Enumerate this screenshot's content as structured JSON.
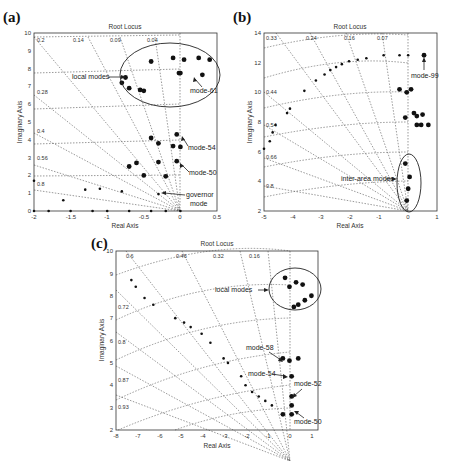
{
  "figure": {
    "panels": [
      {
        "id": "a",
        "label": "(a)",
        "title": "Root Locus",
        "xlabel": "Real Axis",
        "ylabel": "Imaginary Axis",
        "xticks": [
          "-2",
          "-1.5",
          "-1",
          "-0.5",
          "0",
          "0.5"
        ],
        "yticks": [
          "0",
          "1",
          "2",
          "3",
          "4",
          "5",
          "6",
          "7",
          "8",
          "9",
          "10"
        ],
        "damping_labels": [
          "0.2",
          "0.14",
          "0.09",
          "0.04",
          "0.28",
          "0.4",
          "0.56",
          "0.8"
        ],
        "annotations": [
          "local modes",
          "mode-61",
          "mode-54",
          "mode-50",
          "governor",
          "mode"
        ]
      },
      {
        "id": "b",
        "label": "(b)",
        "title": "Root Locus",
        "xlabel": "Real Axis",
        "ylabel": "Imaginary Axis",
        "xticks": [
          "-5",
          "-4",
          "-3",
          "-2",
          "-1",
          "0",
          "1"
        ],
        "yticks": [
          "2",
          "4",
          "6",
          "8",
          "10",
          "12",
          "14"
        ],
        "damping_labels": [
          "0.33",
          "0.24",
          "0.16",
          "0.07",
          "0.44",
          "0.54",
          "0.66",
          "0.8"
        ],
        "annotations": [
          "mode-99",
          "inter-area modes"
        ]
      },
      {
        "id": "c",
        "label": "(c)",
        "title": "Root Locus",
        "xlabel": "Real Axis",
        "ylabel": "Imaginary Axis",
        "xticks": [
          "-8",
          "-7",
          "-6",
          "-5",
          "-4",
          "-3",
          "-2",
          "-1",
          "0",
          "1"
        ],
        "yticks": [
          "2",
          "3",
          "4",
          "5",
          "6",
          "7",
          "8",
          "9",
          "10"
        ],
        "damping_labels": [
          "0.6",
          "0.46",
          "0.32",
          "0.16",
          "0.72",
          "0.8",
          "0.87",
          "0.93"
        ],
        "annotations": [
          "local modes",
          "mode-58",
          "mode-54",
          "mode-52",
          "mode-50"
        ]
      }
    ]
  },
  "chart_data": [
    {
      "type": "scatter",
      "title": "Root Locus",
      "panel": "(a)",
      "xlabel": "Real Axis",
      "ylabel": "Imaginary Axis",
      "xlim": [
        -2,
        0.5
      ],
      "ylim": [
        0,
        10
      ],
      "grid": "damping/frequency (dotted)",
      "series": [
        {
          "name": "local modes",
          "points": [
            [
              -0.1,
              8.6
            ],
            [
              -0.4,
              8.4
            ],
            [
              0.05,
              8.5
            ],
            [
              0.25,
              8.6
            ],
            [
              0.4,
              8.5
            ],
            [
              -0.02,
              7.75
            ],
            [
              0.3,
              7.65
            ],
            [
              -0.75,
              7.5
            ],
            [
              -0.8,
              7.2
            ],
            [
              -0.7,
              6.9
            ],
            [
              -0.55,
              6.8
            ],
            [
              -0.5,
              6.75
            ]
          ]
        },
        {
          "name": "mode-61",
          "points": [
            [
              0.0,
              7.75
            ]
          ]
        },
        {
          "name": "mode-54",
          "points": [
            [
              -0.05,
              4.3
            ],
            [
              -0.4,
              4.1
            ],
            [
              -0.3,
              3.8
            ],
            [
              -0.1,
              3.65
            ],
            [
              0.0,
              3.6
            ]
          ]
        },
        {
          "name": "mode-50",
          "points": [
            [
              -0.05,
              2.8
            ],
            [
              -0.3,
              2.75
            ],
            [
              -0.6,
              2.7
            ],
            [
              -0.5,
              2.0
            ],
            [
              -0.2,
              1.95
            ],
            [
              -0.7,
              2.5
            ]
          ]
        },
        {
          "name": "governor mode",
          "points": [
            [
              -0.3,
              0.95
            ],
            [
              -1.3,
              1.2
            ],
            [
              -1.1,
              1.25
            ],
            [
              -0.8,
              1.1
            ],
            [
              -1.6,
              0.6
            ],
            [
              -2,
              1.7
            ]
          ]
        },
        {
          "name": "real poles",
          "points": [
            [
              -2,
              0
            ],
            [
              -1.8,
              0
            ],
            [
              -1.5,
              0
            ],
            [
              -1.2,
              0
            ],
            [
              -1.0,
              0
            ],
            [
              -0.7,
              0
            ],
            [
              -0.4,
              0
            ],
            [
              -0.2,
              0
            ],
            [
              0,
              0
            ]
          ]
        }
      ]
    },
    {
      "type": "scatter",
      "title": "Root Locus",
      "panel": "(b)",
      "xlabel": "Real Axis",
      "ylabel": "Imaginary Axis",
      "xlim": [
        -5,
        1
      ],
      "ylim": [
        2,
        14
      ],
      "series": [
        {
          "name": "mode-99",
          "points": [
            [
              0.55,
              12.5
            ]
          ]
        },
        {
          "name": "locus",
          "points": [
            [
              -0.85,
              12.5
            ],
            [
              -0.3,
              12.5
            ],
            [
              0,
              12.5
            ],
            [
              -1.45,
              12.3
            ],
            [
              -1.75,
              12.2
            ],
            [
              -2.05,
              12.1
            ],
            [
              -2.3,
              11.9
            ],
            [
              -2.5,
              11.7
            ],
            [
              -2.7,
              11.5
            ],
            [
              -2.9,
              11.2
            ],
            [
              -3.2,
              10.8
            ],
            [
              -3.6,
              10.1
            ],
            [
              -4.1,
              8.9
            ],
            [
              -4.2,
              8.6
            ],
            [
              -4.6,
              7.8
            ],
            [
              -4.7,
              7.3
            ],
            [
              -4.8,
              6.7
            ],
            [
              -5,
              6.2
            ]
          ]
        },
        {
          "name": "other modes",
          "points": [
            [
              -0.3,
              10.2
            ],
            [
              0.1,
              10.2
            ],
            [
              -0.05,
              10.0
            ],
            [
              0.2,
              8.6
            ],
            [
              0.3,
              8.4
            ],
            [
              0.5,
              8.5
            ],
            [
              -0.1,
              8.3
            ],
            [
              0.3,
              7.8
            ],
            [
              0.45,
              7.8
            ],
            [
              0.7,
              7.8
            ]
          ]
        },
        {
          "name": "inter-area modes",
          "points": [
            [
              -0.1,
              5.2
            ],
            [
              0.05,
              4.3
            ],
            [
              0.0,
              3.5
            ],
            [
              -0.05,
              2.7
            ]
          ]
        }
      ]
    },
    {
      "type": "scatter",
      "title": "Root Locus",
      "panel": "(c)",
      "xlabel": "Real Axis",
      "ylabel": "Imaginary Axis",
      "xlim": [
        -8,
        1.2
      ],
      "ylim": [
        2,
        10
      ],
      "series": [
        {
          "name": "local modes",
          "points": [
            [
              -0.3,
              8.8
            ],
            [
              -0.1,
              8.4
            ],
            [
              0.2,
              8.6
            ],
            [
              0.5,
              8.5
            ],
            [
              0.9,
              8.0
            ],
            [
              0.6,
              7.8
            ],
            [
              0.3,
              7.6
            ],
            [
              0.1,
              7.5
            ]
          ]
        },
        {
          "name": "locus",
          "points": [
            [
              -7.3,
              8.7
            ],
            [
              -7.1,
              8.4
            ],
            [
              -6.7,
              7.9
            ],
            [
              -6.3,
              7.6
            ],
            [
              -5.3,
              7.0
            ],
            [
              -4.9,
              6.8
            ],
            [
              -4.6,
              6.6
            ],
            [
              -4.1,
              6.3
            ],
            [
              -3.7,
              5.9
            ],
            [
              -3.1,
              5.2
            ],
            [
              -2.9,
              5.0
            ],
            [
              -2.3,
              4.4
            ],
            [
              -2.1,
              4.0
            ],
            [
              -1.8,
              3.7
            ],
            [
              -1.5,
              3.5
            ],
            [
              -1.2,
              3.3
            ],
            [
              -0.9,
              3.1
            ]
          ]
        },
        {
          "name": "mode-58",
          "points": [
            [
              -0.4,
              5.2
            ],
            [
              -0.1,
              5.1
            ],
            [
              0.3,
              5.2
            ]
          ]
        },
        {
          "name": "mode-54",
          "points": [
            [
              0.0,
              4.4
            ]
          ]
        },
        {
          "name": "mode-52",
          "points": [
            [
              0.0,
              3.5
            ]
          ]
        },
        {
          "name": "mode-50",
          "points": [
            [
              -0.4,
              2.7
            ],
            [
              0.0,
              2.7
            ],
            [
              0.0,
              3.1
            ]
          ]
        }
      ]
    }
  ]
}
